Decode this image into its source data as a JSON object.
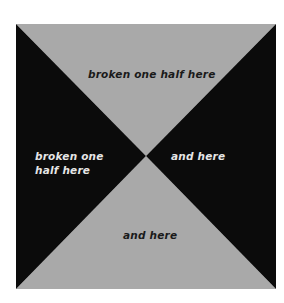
{
  "figure": {
    "colors": {
      "gray": "#a9a9a9",
      "black": "#0b0b0b",
      "background": "#ffffff"
    },
    "regions": {
      "top": {
        "fill": "gray",
        "label": "broken one half here"
      },
      "left": {
        "fill": "black",
        "label": "broken one half here"
      },
      "right": {
        "fill": "black",
        "label": "and here"
      },
      "bottom": {
        "fill": "gray",
        "label": "and here"
      }
    }
  }
}
